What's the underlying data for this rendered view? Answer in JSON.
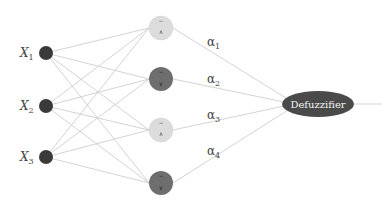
{
  "diagram": {
    "type": "fuzzy-neural-network",
    "colors": {
      "input_node": "#3a3a3a",
      "rule_node_light": "#dcdcdc",
      "rule_node_dark": "#6e6e6e",
      "edge": "#c8c8c8",
      "defuzzifier_fill": "#4a4a4a",
      "defuzzifier_text": "#f2f2f2"
    },
    "inputs": [
      {
        "label": "X",
        "sub": "1"
      },
      {
        "label": "X",
        "sub": "2"
      },
      {
        "label": "X",
        "sub": "3"
      }
    ],
    "rule_nodes": [
      {
        "shade": "light",
        "top_symbol": "−",
        "bottom_symbol": "∧"
      },
      {
        "shade": "dark",
        "top_symbol": "−",
        "bottom_symbol": "∨"
      },
      {
        "shade": "light",
        "top_symbol": "−",
        "bottom_symbol": "∧"
      },
      {
        "shade": "dark",
        "top_symbol": "−",
        "bottom_symbol": "∨"
      }
    ],
    "weights": [
      {
        "label": "α",
        "sub": "1"
      },
      {
        "label": "α",
        "sub": "2"
      },
      {
        "label": "α",
        "sub": "3"
      },
      {
        "label": "α",
        "sub": "4"
      }
    ],
    "output_node": {
      "label": "Defuzzifier"
    }
  }
}
